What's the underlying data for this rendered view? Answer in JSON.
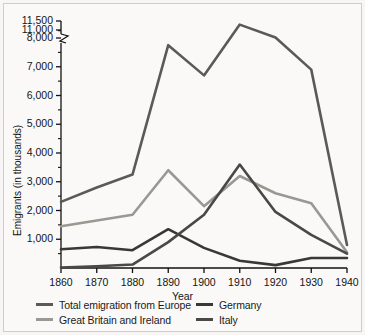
{
  "chart_data": {
    "type": "line",
    "title": "",
    "xlabel": "Year",
    "ylabel": "Emigrants (in thousands)",
    "x": [
      1860,
      1870,
      1880,
      1890,
      1900,
      1910,
      1920,
      1930,
      1940
    ],
    "xtick_labels": [
      "1860",
      "1870",
      "1880",
      "1890",
      "1900",
      "1910",
      "1920",
      "1930",
      "1940"
    ],
    "xlim": [
      1860,
      1940
    ],
    "ytick_labels": [
      "1,000",
      "2,000",
      "3,000",
      "4,000",
      "5,000",
      "6,000",
      "7,000",
      "8,000",
      "11,000",
      "11,500"
    ],
    "ytick_values": [
      1000,
      2000,
      3000,
      4000,
      5000,
      6000,
      7000,
      8000,
      11000,
      11500
    ],
    "yminor_values": [
      500,
      1500,
      2500,
      3500,
      4500,
      5500,
      6500,
      7500,
      10750
    ],
    "ylim": [
      0,
      11500
    ],
    "axis_break": {
      "present": true,
      "between": [
        8000,
        11000
      ],
      "style": "zigzag"
    },
    "grid": false,
    "legend_position": "below",
    "series": [
      {
        "name": "Total emigration from Europe",
        "color": "#5c5a57",
        "values": [
          2300,
          2800,
          3250,
          7750,
          6700,
          11300,
          8200,
          6900,
          800
        ]
      },
      {
        "name": "Great Britain and Ireland",
        "color": "#9a9893",
        "values": [
          1450,
          1650,
          1850,
          3400,
          2150,
          3200,
          2600,
          2250,
          550
        ]
      },
      {
        "name": "Germany",
        "color": "#3a3836",
        "values": [
          650,
          730,
          620,
          1350,
          700,
          250,
          100,
          350,
          350
        ]
      },
      {
        "name": "Italy",
        "color": "#4a4845",
        "values": [
          20,
          60,
          120,
          900,
          1850,
          3600,
          1950,
          1150,
          500
        ]
      }
    ]
  },
  "legend": {
    "entries": [
      {
        "label": "Total emigration from Europe"
      },
      {
        "label": "Germany"
      },
      {
        "label": "Great Britain and Ireland"
      },
      {
        "label": "Italy"
      }
    ]
  }
}
